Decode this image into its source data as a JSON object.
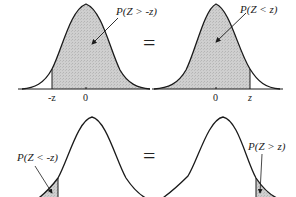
{
  "colors": {
    "curve": "#1a1a1a",
    "shade": "#c8c8c8",
    "background": "#ffffff"
  },
  "top_row": {
    "equals": "=",
    "left_panel": {
      "annotation": "P(Z > -z)",
      "tick_labels": [
        "-z",
        "0"
      ],
      "shaded_region": "right of -z"
    },
    "right_panel": {
      "annotation": "P(Z < z)",
      "tick_labels": [
        "0",
        "z"
      ],
      "shaded_region": "left of z"
    }
  },
  "bottom_row": {
    "equals": "=",
    "left_panel": {
      "annotation": "P(Z < -z)",
      "shaded_region": "left tail below -z"
    },
    "right_panel": {
      "annotation": "P(Z > z)",
      "shaded_region": "right tail above z"
    }
  }
}
